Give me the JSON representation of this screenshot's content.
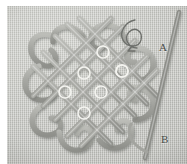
{
  "image": {
    "subject": "celtic-square-knot-weaving-in-progress",
    "background_color": "#c4c5c0",
    "cord_color": "#a9aaa5",
    "marker_color": "#f2f2ee",
    "border_color": "#ffffff"
  },
  "labels": {
    "needle_upper": "A",
    "needle_lower": "B"
  },
  "annotations": {
    "loop_arrow": "curved-loop-arrow-icon",
    "marker_count": 7
  },
  "markers": [
    {
      "name": "crossing-marker-1",
      "cx": 103,
      "cy": 52,
      "r": 6
    },
    {
      "name": "crossing-marker-2",
      "cx": 122,
      "cy": 71,
      "r": 6
    },
    {
      "name": "crossing-marker-3",
      "cx": 84,
      "cy": 73,
      "r": 6
    },
    {
      "name": "crossing-marker-4",
      "cx": 101,
      "cy": 92,
      "r": 6
    },
    {
      "name": "crossing-marker-5",
      "cx": 65,
      "cy": 92,
      "r": 6
    },
    {
      "name": "crossing-marker-6",
      "cx": 84,
      "cy": 113,
      "r": 6
    },
    {
      "name": "crossing-marker-7",
      "cx": 122,
      "cy": 71,
      "r": 6
    }
  ],
  "needle": {
    "name": "needle-with-thread",
    "from": {
      "x": 175,
      "y": 14
    },
    "to": {
      "x": 150,
      "y": 150
    },
    "color": "#8e8f8a"
  }
}
